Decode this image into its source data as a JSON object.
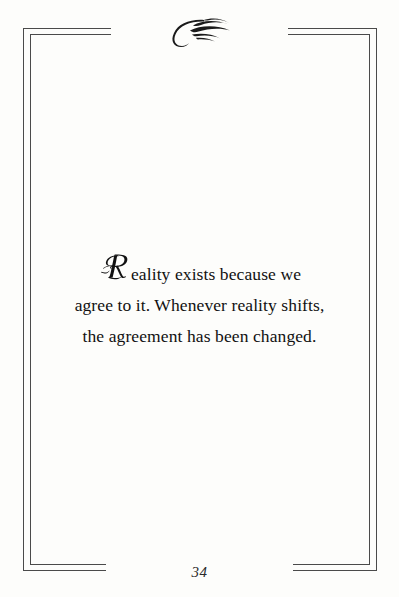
{
  "page": {
    "background_color": "#fdfdfb",
    "border_color": "#4a4a4a",
    "text_color": "#111111",
    "number": "34"
  },
  "ornament": {
    "name": "flourish-ornament",
    "description": "calligraphic swash flourish",
    "color": "#1a1a1a"
  },
  "quote": {
    "dropcap": "R",
    "lines": [
      "eality exists because we",
      "agree to it. Whenever reality shifts,",
      "the agreement has been changed."
    ],
    "full_text": "Reality exists because we agree to it. Whenever reality shifts, the agreement has been changed."
  }
}
